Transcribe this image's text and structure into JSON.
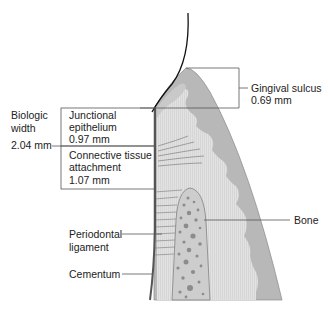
{
  "colors": {
    "gingiva_dark": "#b4b4b4",
    "gingiva_light": "#d7d7d7",
    "connective": "#e4e4e4",
    "bone": "#cfcfcf",
    "bone_pores": "#8a8a8a",
    "lines": "#555555",
    "text": "#222222"
  },
  "labels": {
    "biologic_width": {
      "line1": "Biologic",
      "line2": "width",
      "value": "2.04 mm"
    },
    "junctional_epithelium": {
      "line1": "Junctional",
      "line2": "epithelium",
      "value": "0.97 mm"
    },
    "connective_tissue": {
      "line1": "Connective tissue",
      "line2": "attachment",
      "value": "1.07 mm"
    },
    "gingival_sulcus": {
      "line1": "Gingival sulcus",
      "value": "0.69 mm"
    },
    "bone": {
      "line1": "Bone"
    },
    "periodontal_ligament": {
      "line1": "Periodontal",
      "line2": "ligament"
    },
    "cementum": {
      "line1": "Cementum"
    }
  }
}
